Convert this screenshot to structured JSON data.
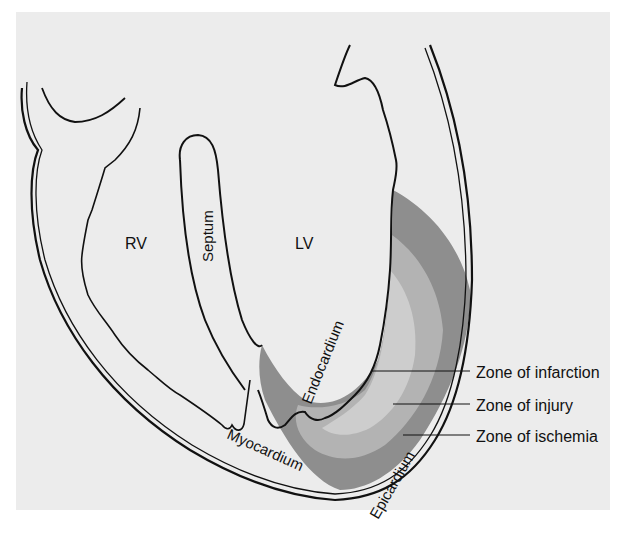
{
  "figure": {
    "labels": {
      "rv": "RV",
      "lv": "LV",
      "septum": "Septum",
      "endocardium": "Endocardium",
      "myocardium": "Myocardium",
      "epicardium": "Epicardium"
    },
    "legend": [
      {
        "label": "Zone of infarction",
        "shade": "#c9c9c9"
      },
      {
        "label": "Zone of injury",
        "shade": "#b3b3b3"
      },
      {
        "label": "Zone of ischemia",
        "shade": "#8e8e8e"
      }
    ],
    "colors": {
      "page": "#ffffff",
      "panel": "#ececec",
      "line": "#111111"
    }
  }
}
